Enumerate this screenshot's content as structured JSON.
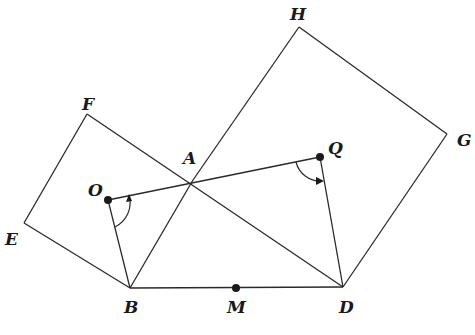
{
  "diagram": {
    "type": "geometry",
    "points": {
      "A": {
        "label": "A",
        "x": 193,
        "y": 180
      },
      "B": {
        "label": "B",
        "x": 130,
        "y": 288
      },
      "D": {
        "label": "D",
        "x": 343,
        "y": 287
      },
      "E": {
        "label": "E",
        "x": 24,
        "y": 223
      },
      "F": {
        "label": "F",
        "x": 87,
        "y": 114
      },
      "G": {
        "label": "G",
        "x": 447,
        "y": 134
      },
      "H": {
        "label": "H",
        "x": 299,
        "y": 27
      },
      "M": {
        "label": "M",
        "x": 236,
        "y": 288
      },
      "O": {
        "label": "O",
        "x": 108,
        "y": 200
      },
      "Q": {
        "label": "Q",
        "x": 320,
        "y": 157
      }
    },
    "dots": [
      "O",
      "Q",
      "M"
    ],
    "segments": [
      [
        "B",
        "E"
      ],
      [
        "E",
        "F"
      ],
      [
        "F",
        "A"
      ],
      [
        "A",
        "B"
      ],
      [
        "A",
        "H"
      ],
      [
        "H",
        "G"
      ],
      [
        "G",
        "D"
      ],
      [
        "D",
        "A"
      ],
      [
        "B",
        "D"
      ],
      [
        "O",
        "Q"
      ],
      [
        "O",
        "B"
      ],
      [
        "Q",
        "D"
      ]
    ],
    "angle_marks": [
      {
        "vertex": "O",
        "from": "B",
        "to": "Q"
      },
      {
        "vertex": "Q",
        "from": "O",
        "to": "D"
      }
    ]
  }
}
